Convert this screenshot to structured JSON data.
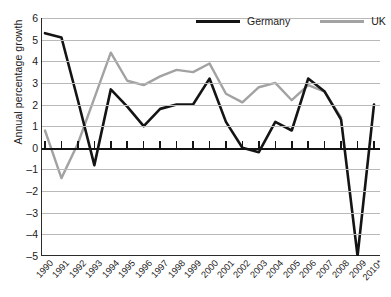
{
  "chart_data": {
    "type": "line",
    "title": "",
    "xlabel": "",
    "ylabel": "Annual percentage growth",
    "ylim": [
      -5,
      6
    ],
    "ystep": 1,
    "grid": true,
    "legend_position": "top-right",
    "categories": [
      "1990",
      "1991",
      "1992",
      "1993",
      "1994",
      "1995",
      "1996",
      "1997",
      "1998",
      "1999",
      "2000",
      "2001",
      "2002",
      "2003",
      "2004",
      "2005",
      "2006",
      "2007",
      "2008",
      "2009",
      "2010*"
    ],
    "yticks": [
      "6",
      "5",
      "4",
      "3",
      "2",
      "1",
      "0",
      "–1",
      "–2",
      "–3",
      "–4",
      "–5"
    ],
    "series": [
      {
        "name": "Germany",
        "color": "#141414",
        "values": [
          5.3,
          5.1,
          2.2,
          -0.8,
          2.7,
          1.9,
          1.0,
          1.8,
          2.0,
          2.0,
          3.2,
          1.2,
          0.0,
          -0.2,
          1.2,
          0.8,
          3.2,
          2.6,
          1.3,
          -5.0,
          2.0
        ]
      },
      {
        "name": "UK",
        "color": "#a2a2a2",
        "values": [
          0.8,
          -1.4,
          0.2,
          2.3,
          4.4,
          3.1,
          2.9,
          3.3,
          3.6,
          3.5,
          3.9,
          2.5,
          2.1,
          2.8,
          3.0,
          2.2,
          2.9,
          2.6,
          1.4,
          null,
          null
        ]
      }
    ]
  },
  "legend": {
    "items": [
      {
        "label": "Germany",
        "swatch": "de"
      },
      {
        "label": "UK",
        "swatch": "uk"
      }
    ]
  }
}
